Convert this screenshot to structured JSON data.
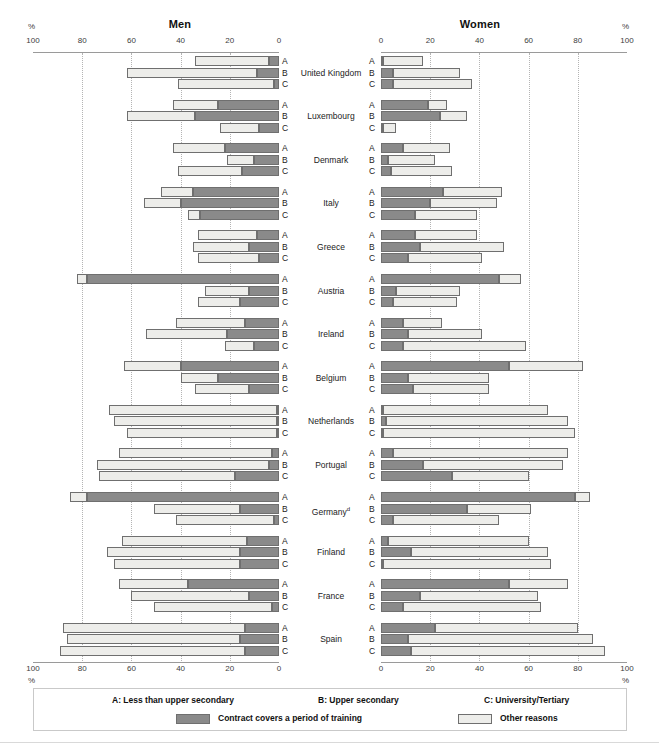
{
  "panels": {
    "men": {
      "title": "Men",
      "pct_label": "%",
      "direction": "rtl",
      "ticks": [
        100,
        80,
        60,
        40,
        20,
        0
      ]
    },
    "women": {
      "title": "Women",
      "pct_label": "%",
      "direction": "ltr",
      "ticks": [
        0,
        20,
        40,
        60,
        80,
        100
      ]
    }
  },
  "levels": [
    "A",
    "B",
    "C"
  ],
  "legend": {
    "categories": [
      {
        "key": "A",
        "label": "A: Less than upper secondary"
      },
      {
        "key": "B",
        "label": "B: Upper secondary"
      },
      {
        "key": "C",
        "label": "C: University/Tertiary"
      }
    ],
    "series": [
      {
        "key": "training",
        "label": "Contract covers a period of training",
        "color": "#8a8a8a"
      },
      {
        "key": "other",
        "label": "Other reasons",
        "color": "#ededea"
      }
    ]
  },
  "colors": {
    "training": "#8a8a8a",
    "other": "#ededea",
    "border": "#6f6f6f",
    "grid": "#b4b4b4",
    "axis": "#9a9a9a"
  },
  "countries": [
    {
      "name": "United Kingdom",
      "footnote": ""
    },
    {
      "name": "Luxembourg",
      "footnote": ""
    },
    {
      "name": "Denmark",
      "footnote": ""
    },
    {
      "name": "Italy",
      "footnote": ""
    },
    {
      "name": "Greece",
      "footnote": ""
    },
    {
      "name": "Austria",
      "footnote": ""
    },
    {
      "name": "Ireland",
      "footnote": ""
    },
    {
      "name": "Belgium",
      "footnote": ""
    },
    {
      "name": "Netherlands",
      "footnote": ""
    },
    {
      "name": "Portugal",
      "footnote": ""
    },
    {
      "name": "Germany",
      "footnote": "d"
    },
    {
      "name": "Finland",
      "footnote": ""
    },
    {
      "name": "France",
      "footnote": ""
    },
    {
      "name": "Spain",
      "footnote": ""
    }
  ],
  "chart_data": {
    "type": "bar",
    "orientation": "horizontal",
    "layout": "back-to-back paired panels (Men left, mirrored; Women right)",
    "xlabel": "%",
    "ylabel": "",
    "xlim": [
      0,
      100
    ],
    "grid": "vertical dotted gridlines every 20%",
    "legend_position": "bottom box",
    "stacking": "stacked: training segment nearest the zero axis, other reasons outward",
    "categories_axis": "country × educational attainment (A/B/C)",
    "series": [
      {
        "name": "Contract covers a period of training",
        "color": "#8a8a8a"
      },
      {
        "name": "Other reasons",
        "color": "#ededea"
      }
    ],
    "data": [
      {
        "country": "United Kingdom",
        "men": {
          "A": {
            "training": 4,
            "other": 30
          },
          "B": {
            "training": 9,
            "other": 53
          },
          "C": {
            "training": 2,
            "other": 39
          }
        },
        "women": {
          "A": {
            "training": 1,
            "other": 16
          },
          "B": {
            "training": 5,
            "other": 27
          },
          "C": {
            "training": 5,
            "other": 32
          }
        }
      },
      {
        "country": "Luxembourg",
        "men": {
          "A": {
            "training": 25,
            "other": 18
          },
          "B": {
            "training": 34,
            "other": 28
          },
          "C": {
            "training": 8,
            "other": 16
          }
        },
        "women": {
          "A": {
            "training": 19,
            "other": 8
          },
          "B": {
            "training": 24,
            "other": 11
          },
          "C": {
            "training": 1,
            "other": 5
          }
        }
      },
      {
        "country": "Denmark",
        "men": {
          "A": {
            "training": 22,
            "other": 21
          },
          "B": {
            "training": 10,
            "other": 11
          },
          "C": {
            "training": 15,
            "other": 26
          }
        },
        "women": {
          "A": {
            "training": 9,
            "other": 19
          },
          "B": {
            "training": 3,
            "other": 19
          },
          "C": {
            "training": 4,
            "other": 25
          }
        }
      },
      {
        "country": "Italy",
        "men": {
          "A": {
            "training": 35,
            "other": 13
          },
          "B": {
            "training": 40,
            "other": 15
          },
          "C": {
            "training": 32,
            "other": 5
          }
        },
        "women": {
          "A": {
            "training": 25,
            "other": 24
          },
          "B": {
            "training": 20,
            "other": 27
          },
          "C": {
            "training": 14,
            "other": 25
          }
        }
      },
      {
        "country": "Greece",
        "men": {
          "A": {
            "training": 9,
            "other": 24
          },
          "B": {
            "training": 12,
            "other": 23
          },
          "C": {
            "training": 8,
            "other": 25
          }
        },
        "women": {
          "A": {
            "training": 14,
            "other": 25
          },
          "B": {
            "training": 16,
            "other": 34
          },
          "C": {
            "training": 11,
            "other": 30
          }
        }
      },
      {
        "country": "Austria",
        "men": {
          "A": {
            "training": 78,
            "other": 4
          },
          "B": {
            "training": 12,
            "other": 18
          },
          "C": {
            "training": 16,
            "other": 17
          }
        },
        "women": {
          "A": {
            "training": 48,
            "other": 9
          },
          "B": {
            "training": 6,
            "other": 26
          },
          "C": {
            "training": 5,
            "other": 26
          }
        }
      },
      {
        "country": "Ireland",
        "men": {
          "A": {
            "training": 14,
            "other": 28
          },
          "B": {
            "training": 21,
            "other": 33
          },
          "C": {
            "training": 10,
            "other": 12
          }
        },
        "women": {
          "A": {
            "training": 9,
            "other": 16
          },
          "B": {
            "training": 11,
            "other": 30
          },
          "C": {
            "training": 9,
            "other": 50
          }
        }
      },
      {
        "country": "Belgium",
        "men": {
          "A": {
            "training": 40,
            "other": 23
          },
          "B": {
            "training": 25,
            "other": 15
          },
          "C": {
            "training": 12,
            "other": 22
          }
        },
        "women": {
          "A": {
            "training": 52,
            "other": 30
          },
          "B": {
            "training": 11,
            "other": 33
          },
          "C": {
            "training": 13,
            "other": 31
          }
        }
      },
      {
        "country": "Netherlands",
        "men": {
          "A": {
            "training": 1,
            "other": 68
          },
          "B": {
            "training": 1,
            "other": 66
          },
          "C": {
            "training": 1,
            "other": 61
          }
        },
        "women": {
          "A": {
            "training": 1,
            "other": 67
          },
          "B": {
            "training": 2,
            "other": 74
          },
          "C": {
            "training": 1,
            "other": 78
          }
        }
      },
      {
        "country": "Portugal",
        "men": {
          "A": {
            "training": 3,
            "other": 62
          },
          "B": {
            "training": 4,
            "other": 70
          },
          "C": {
            "training": 18,
            "other": 55
          }
        },
        "women": {
          "A": {
            "training": 5,
            "other": 71
          },
          "B": {
            "training": 17,
            "other": 57
          },
          "C": {
            "training": 29,
            "other": 31
          }
        }
      },
      {
        "country": "Germany",
        "men": {
          "A": {
            "training": 78,
            "other": 7
          },
          "B": {
            "training": 16,
            "other": 35
          },
          "C": {
            "training": 2,
            "other": 40
          }
        },
        "women": {
          "A": {
            "training": 79,
            "other": 6
          },
          "B": {
            "training": 35,
            "other": 26
          },
          "C": {
            "training": 5,
            "other": 43
          }
        }
      },
      {
        "country": "Finland",
        "men": {
          "A": {
            "training": 13,
            "other": 51
          },
          "B": {
            "training": 16,
            "other": 54
          },
          "C": {
            "training": 16,
            "other": 51
          }
        },
        "women": {
          "A": {
            "training": 3,
            "other": 57
          },
          "B": {
            "training": 12,
            "other": 56
          },
          "C": {
            "training": 1,
            "other": 68
          }
        }
      },
      {
        "country": "France",
        "men": {
          "A": {
            "training": 37,
            "other": 28
          },
          "B": {
            "training": 12,
            "other": 48
          },
          "C": {
            "training": 3,
            "other": 48
          }
        },
        "women": {
          "A": {
            "training": 52,
            "other": 24
          },
          "B": {
            "training": 16,
            "other": 48
          },
          "C": {
            "training": 9,
            "other": 56
          }
        }
      },
      {
        "country": "Spain",
        "men": {
          "A": {
            "training": 14,
            "other": 74
          },
          "B": {
            "training": 16,
            "other": 70
          },
          "C": {
            "training": 14,
            "other": 75
          }
        },
        "women": {
          "A": {
            "training": 22,
            "other": 58
          },
          "B": {
            "training": 11,
            "other": 75
          },
          "C": {
            "training": 12,
            "other": 79
          }
        }
      }
    ]
  }
}
